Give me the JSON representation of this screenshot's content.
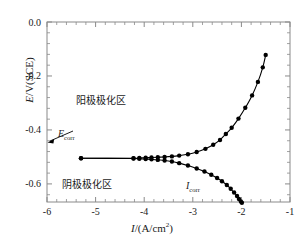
{
  "chart_data": {
    "type": "line",
    "title": "",
    "xlabel": "I/(A/cm2)",
    "ylabel": "E/V(SCE)",
    "xlim": [
      -6,
      -1
    ],
    "ylim": [
      -0.667,
      0.0
    ],
    "xticks": [
      "-6",
      "-5",
      "-4",
      "-3",
      "-2",
      "-1"
    ],
    "ytick_values": [
      0.0,
      -0.2,
      -0.4,
      -0.6
    ],
    "yticks": [
      "0.0",
      "-0.2",
      "-0.4",
      "-0.6"
    ],
    "grid": false,
    "legend": "none",
    "minor_ticks_per_interval": 5,
    "series": [
      {
        "name": "anodic-branch",
        "marker": "filled-circle",
        "x": [
          -5.3,
          -4.22,
          -4.1,
          -3.97,
          -3.85,
          -3.72,
          -3.58,
          -3.43,
          -3.28,
          -3.1,
          -2.92,
          -2.74,
          -2.58,
          -2.44,
          -2.32,
          -2.2,
          -2.06,
          -1.92,
          -1.78,
          -1.66,
          -1.56,
          -1.5
        ],
        "y": [
          -0.505,
          -0.505,
          -0.504,
          -0.503,
          -0.502,
          -0.501,
          -0.5,
          -0.498,
          -0.495,
          -0.49,
          -0.482,
          -0.47,
          -0.455,
          -0.437,
          -0.415,
          -0.392,
          -0.358,
          -0.318,
          -0.272,
          -0.222,
          -0.168,
          -0.122
        ]
      },
      {
        "name": "cathodic-branch",
        "marker": "filled-circle",
        "x": [
          -5.3,
          -4.22,
          -4.1,
          -3.97,
          -3.85,
          -3.72,
          -3.58,
          -3.43,
          -3.28,
          -3.1,
          -2.92,
          -2.76,
          -2.62,
          -2.5,
          -2.4,
          -2.3,
          -2.22,
          -2.15,
          -2.09,
          -2.05,
          -2.01,
          -1.99
        ],
        "y": [
          -0.505,
          -0.506,
          -0.507,
          -0.508,
          -0.509,
          -0.511,
          -0.513,
          -0.517,
          -0.523,
          -0.532,
          -0.543,
          -0.554,
          -0.566,
          -0.578,
          -0.59,
          -0.604,
          -0.618,
          -0.632,
          -0.645,
          -0.656,
          -0.665,
          -0.67
        ]
      }
    ],
    "annotations": [
      {
        "name": "anodic-zone-label",
        "text": "阳极极化区",
        "x": -5.0,
        "y": -0.29
      },
      {
        "name": "cathodic-zone-label",
        "text": "阴极极化区",
        "x": -5.25,
        "y": -0.6
      },
      {
        "name": "ecorr-label",
        "text": "Ecorr",
        "x": -5.78,
        "y": -0.41
      },
      {
        "name": "icorr-label",
        "text": "Icorr",
        "x": -3.15,
        "y": -0.62
      }
    ],
    "annotation_text": {
      "anodic_zone": "阳极极化区",
      "cathodic_zone": "阴极极化区",
      "ecorr_main": "E",
      "ecorr_sub": "corr",
      "icorr_main": "I",
      "icorr_sub": "corr"
    },
    "axis_label_parts": {
      "y_italic": "E",
      "y_rest": "/V(SCE)",
      "x_italic": "I",
      "x_rest_pre": "/(A/cm",
      "x_sup": "2",
      "x_rest_post": ")"
    },
    "colors": {
      "line": "#000000",
      "marker": "#000000",
      "axis": "#8a8a8a",
      "text": "#1a1a1a",
      "background": "#ffffff"
    }
  }
}
